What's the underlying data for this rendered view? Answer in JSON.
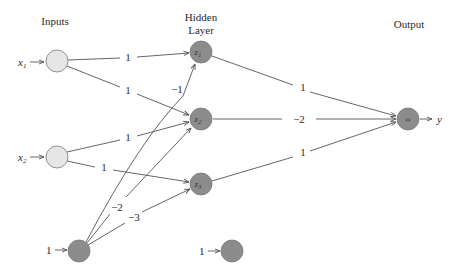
{
  "headers": {
    "inputs": "Inputs",
    "hidden_line1": "Hidden",
    "hidden_line2": "Layer",
    "output": "Output"
  },
  "inputs": {
    "x1": {
      "name": "x",
      "sub": "1"
    },
    "x2": {
      "name": "x",
      "sub": "2"
    },
    "bias_input": "1",
    "bias_hidden": "1"
  },
  "hidden": {
    "z1": {
      "name": "z",
      "sub": "1"
    },
    "z2": {
      "name": "z",
      "sub": "2"
    },
    "z3": {
      "name": "z",
      "sub": "3"
    }
  },
  "output": {
    "node": "o",
    "label": "y"
  },
  "weights": {
    "x1_z1": "1",
    "x1_z2": "1",
    "x2_z2": "1",
    "x2_z3": "1",
    "b_z1": "−1",
    "b_z2": "−2",
    "b_z3": "−3",
    "z1_o": "1",
    "z2_o": "−2",
    "z3_o": "1"
  },
  "colors": {
    "input_fill": "#e6e6e6",
    "node_fill": "#8c8c8c",
    "edge": "#555555",
    "text": "#2a2a2a"
  }
}
